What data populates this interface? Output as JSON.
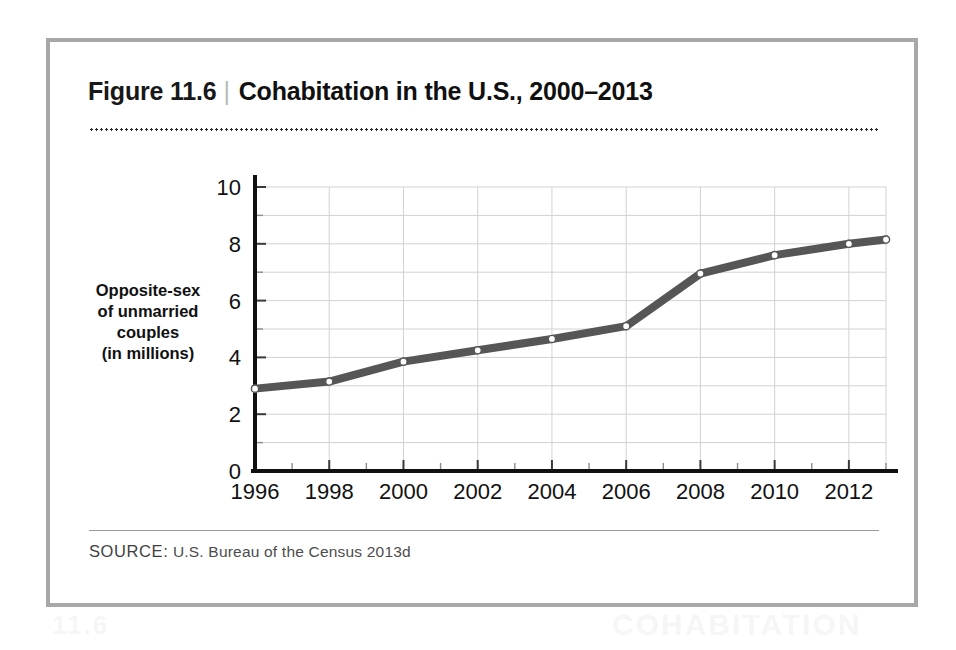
{
  "figure": {
    "number": "Figure 11.6",
    "separator": "|",
    "caption": "Cohabitation in the U.S., 2000–2013",
    "source_label": "SOURCE:",
    "source_text": " U.S. Bureau of the Census 2013d"
  },
  "bleed_text": {
    "right": "COHABITATION",
    "left": "11.6"
  },
  "colors": {
    "frame": "#a8a8a8",
    "line": "#565656",
    "axis": "#101010",
    "grid": "#d2d2d2",
    "marker_fill": "#ffffff",
    "text": "#111111",
    "source": "#4c4c4c"
  },
  "chart_data": {
    "type": "line",
    "title": "Cohabitation in the U.S., 2000–2013",
    "xlabel": "",
    "ylabel": "Opposite-sex of unmarried couples (in millions)",
    "ylabel_lines": [
      "Opposite-sex",
      "of unmarried",
      "couples",
      "(in millions)"
    ],
    "x": [
      1996,
      1998,
      2000,
      2002,
      2004,
      2006,
      2008,
      2010,
      2012,
      2013
    ],
    "values": [
      2.9,
      3.15,
      3.85,
      4.25,
      4.65,
      5.1,
      6.95,
      7.6,
      8.0,
      8.15
    ],
    "xlim": [
      1996,
      2013
    ],
    "ylim": [
      0,
      10
    ],
    "xticks": [
      1996,
      1998,
      2000,
      2002,
      2004,
      2006,
      2008,
      2010,
      2012
    ],
    "xticklabels": [
      "1996",
      "1998",
      "2000",
      "2002",
      "2004",
      "2006",
      "2008",
      "2010",
      "2012"
    ],
    "xminorticks": [
      1997,
      1999,
      2001,
      2003,
      2005,
      2007,
      2009,
      2011,
      2013
    ],
    "yticks": [
      0,
      2,
      4,
      6,
      8,
      10
    ],
    "yticklabels": [
      "0",
      "2",
      "4",
      "6",
      "8",
      "10"
    ],
    "yminorticks": [
      1,
      3,
      5,
      7,
      9
    ],
    "grid": true,
    "legend": false,
    "markers": "circle-open"
  }
}
